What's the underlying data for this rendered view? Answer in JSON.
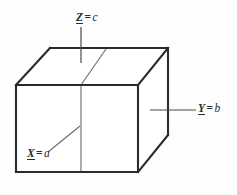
{
  "figure": {
    "kind": "3d-box-diagram",
    "background_color": "#fdfdfd",
    "stroke_color": "#2b2b2b",
    "thin_stroke_color": "#555555",
    "labels": {
      "top": {
        "variable": "Z",
        "equals": "=",
        "value": "c"
      },
      "right": {
        "variable": "Y",
        "equals": "=",
        "value": "b"
      },
      "bottom_left": {
        "variable": "X",
        "equals": "=",
        "value": "a"
      }
    },
    "geometry": {
      "front_top_left": [
        16,
        85
      ],
      "front_top_right": [
        138,
        85
      ],
      "front_bottom_left": [
        16,
        172
      ],
      "front_bottom_right": [
        138,
        172
      ],
      "back_top_left": [
        50,
        48
      ],
      "back_top_right": [
        168,
        48
      ],
      "back_bottom_right": [
        168,
        135
      ],
      "interior_vertical_x": 81,
      "interior_diagonal_from": [
        81,
        85
      ],
      "interior_diagonal_to": [
        106,
        50
      ]
    },
    "leaders": {
      "z_leader": {
        "from": [
          81,
          27
        ],
        "to": [
          81,
          63
        ]
      },
      "y_leader": {
        "from": [
          196,
          110
        ],
        "to": [
          150,
          110
        ]
      },
      "x_leader": {
        "from": [
          48,
          152
        ],
        "to": [
          80,
          126
        ]
      }
    }
  }
}
